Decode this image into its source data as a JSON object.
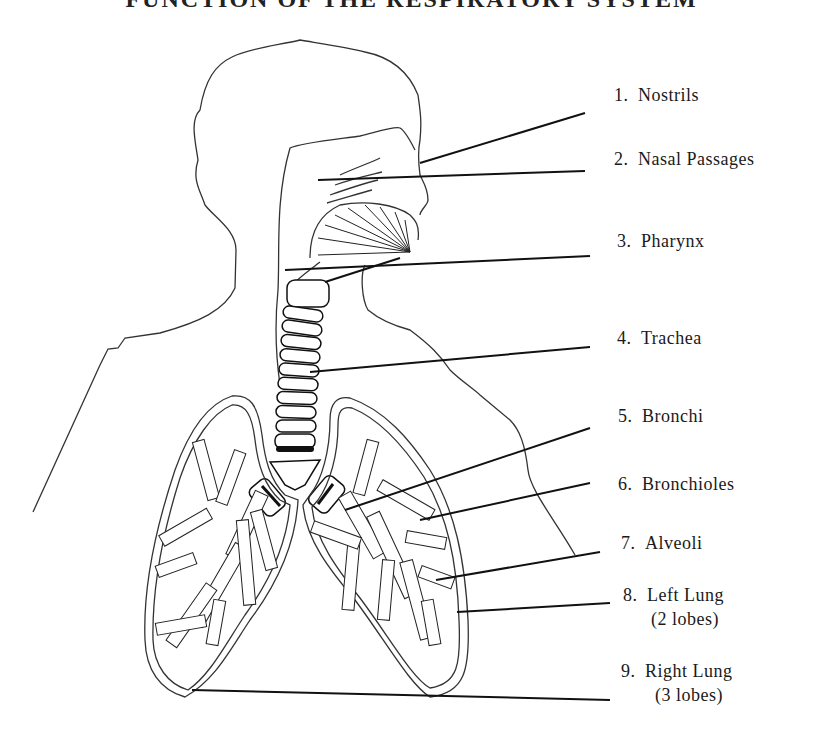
{
  "title": "FUNCTION OF THE RESPIRATORY SYSTEM",
  "labels": [
    {
      "num": "1.",
      "text": "Nostrils",
      "sub": ""
    },
    {
      "num": "2.",
      "text": "Nasal Passages",
      "sub": ""
    },
    {
      "num": "3.",
      "text": "Pharynx",
      "sub": ""
    },
    {
      "num": "4.",
      "text": "Trachea",
      "sub": ""
    },
    {
      "num": "5.",
      "text": "Bronchi",
      "sub": ""
    },
    {
      "num": "6.",
      "text": "Bronchioles",
      "sub": ""
    },
    {
      "num": "7.",
      "text": "Alveoli",
      "sub": ""
    },
    {
      "num": "8.",
      "text": "Left Lung",
      "sub": "(2 lobes)"
    },
    {
      "num": "9.",
      "text": "Right Lung",
      "sub": "(3 lobes)"
    }
  ],
  "colors": {
    "line": "#222222",
    "background": "#ffffff"
  }
}
